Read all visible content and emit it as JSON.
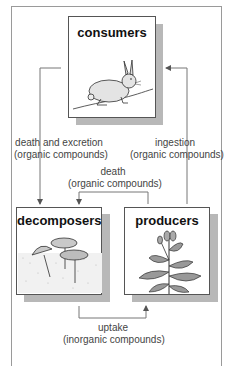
{
  "boxes": {
    "consumers": {
      "title": "consumers",
      "illustration": "rabbit-icon"
    },
    "decomposers": {
      "title": "decomposers",
      "illustration": "mushroom-icon"
    },
    "producers": {
      "title": "producers",
      "illustration": "plant-icon"
    }
  },
  "arrows": {
    "death_excretion": {
      "line1": "death and excretion",
      "line2": "(organic compounds)"
    },
    "ingestion": {
      "line1": "ingestion",
      "line2": "(organic compounds)"
    },
    "death": {
      "line1": "death",
      "line2": "(organic compounds)"
    },
    "uptake": {
      "line1": "uptake",
      "line2": "(inorganic compounds)"
    }
  },
  "colors": {
    "line": "#666666",
    "shadow": "#b8b8b8",
    "box_border": "#555555"
  }
}
